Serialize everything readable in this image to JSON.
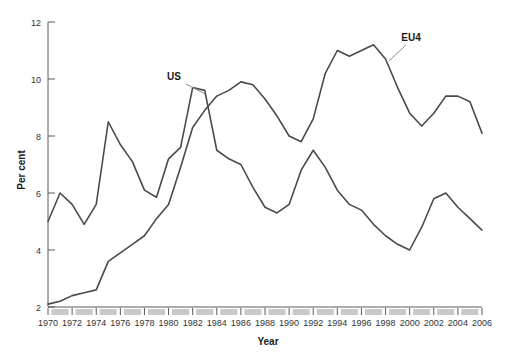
{
  "chart_data": {
    "type": "line",
    "title": "",
    "xlabel": "Year",
    "ylabel": "Per cent",
    "xlim": [
      1970,
      2006
    ],
    "ylim": [
      2,
      12
    ],
    "yticks": [
      2,
      4,
      6,
      8,
      10,
      12
    ],
    "ytick_labels": [
      "2",
      "4",
      "6",
      "8",
      "10",
      "12"
    ],
    "xticks": [
      1970,
      1972,
      1974,
      1976,
      1978,
      1980,
      1982,
      1984,
      1986,
      1988,
      1990,
      1992,
      1994,
      1996,
      1998,
      2000,
      2002,
      2004,
      2006
    ],
    "xtick_labels": [
      "1970",
      "1972",
      "1974",
      "1976",
      "1978",
      "1980",
      "1982",
      "1984",
      "1986",
      "1988",
      "1990",
      "1992",
      "1994",
      "1996",
      "1998",
      "2000",
      "2002",
      "2004",
      "2006"
    ],
    "grid": false,
    "legend_position": "inline-annotation",
    "x": [
      1970,
      1971,
      1972,
      1973,
      1974,
      1975,
      1976,
      1977,
      1978,
      1979,
      1980,
      1981,
      1982,
      1983,
      1984,
      1985,
      1986,
      1987,
      1988,
      1989,
      1990,
      1991,
      1992,
      1993,
      1994,
      1995,
      1996,
      1997,
      1998,
      1999,
      2000,
      2001,
      2002,
      2003,
      2004,
      2005,
      2006
    ],
    "series": [
      {
        "name": "US",
        "label": "US",
        "color": "#4a4a4a",
        "values": [
          5.0,
          6.0,
          5.6,
          4.9,
          5.6,
          8.5,
          7.7,
          7.1,
          6.1,
          5.85,
          7.2,
          7.6,
          9.7,
          9.6,
          7.5,
          7.2,
          7.0,
          6.2,
          5.5,
          5.3,
          5.6,
          6.8,
          7.5,
          6.9,
          6.1,
          5.6,
          5.4,
          4.9,
          4.5,
          4.2,
          4.0,
          4.8,
          5.8,
          6.0,
          5.5,
          5.1,
          4.7
        ]
      },
      {
        "name": "EU4",
        "label": "EU4",
        "color": "#4a4a4a",
        "values": [
          2.1,
          2.2,
          2.4,
          2.5,
          2.6,
          3.6,
          3.9,
          4.2,
          4.5,
          5.1,
          5.6,
          6.9,
          8.3,
          8.9,
          9.4,
          9.6,
          9.9,
          9.8,
          9.3,
          8.7,
          8.0,
          7.8,
          8.6,
          10.2,
          11.0,
          10.8,
          11.0,
          11.2,
          10.7,
          9.7,
          8.8,
          8.35,
          8.8,
          9.4,
          9.4,
          9.2,
          8.1
        ]
      }
    ],
    "annotations": [
      {
        "text": "US",
        "x_px": 174,
        "y_px": 80,
        "leader_from_px": [
          186,
          84
        ],
        "leader_to_px": [
          205,
          94
        ]
      },
      {
        "text": "EU4",
        "x_px": 411,
        "y_px": 41,
        "leader_from_px": [
          406,
          45
        ],
        "leader_to_px": [
          389,
          61
        ]
      }
    ]
  },
  "axes": {
    "y_axis_title": "Per cent",
    "x_axis_title": "Year"
  }
}
